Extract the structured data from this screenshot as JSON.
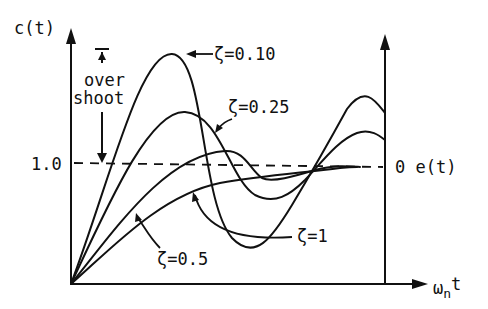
{
  "diagram": {
    "type": "second-order step response vs. natural frequency time",
    "y_axis_label": "c(t)",
    "x_axis_label_main": "ω",
    "x_axis_label_sub": "n",
    "x_axis_label_suffix": "t",
    "y_reference_label": "1.0",
    "right_axis_label": "0 e(t)",
    "overshoot_label_line1": "over",
    "overshoot_label_line2": "shoot",
    "curves": [
      {
        "id": "zeta-0.10",
        "label": "ζ=0.10"
      },
      {
        "id": "zeta-0.25",
        "label": "ζ=0.25"
      },
      {
        "id": "zeta-0.5",
        "label": "ζ=0.5"
      },
      {
        "id": "zeta-1",
        "label": "ζ=1"
      }
    ]
  }
}
